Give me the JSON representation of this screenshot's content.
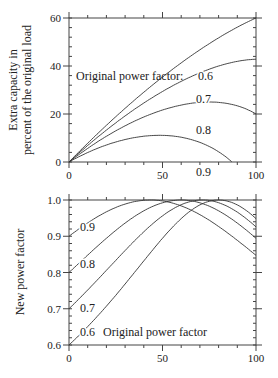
{
  "chart_data": [
    {
      "type": "line",
      "title": "",
      "xlabel": "",
      "ylabel": [
        "Extra capacity in",
        "percent of the original load"
      ],
      "xlim": [
        0,
        100
      ],
      "ylim": [
        0,
        60
      ],
      "xticks": [
        "0",
        "50",
        "100"
      ],
      "yticks": [
        "0",
        "20",
        "40",
        "60"
      ],
      "legend_title": "Original power factor:",
      "series": [
        {
          "name": "0.6",
          "x": [
            0,
            10,
            20,
            30,
            40,
            50,
            60,
            70,
            80,
            90,
            100
          ],
          "values": [
            0,
            7.3,
            14.8,
            22.4,
            30.0,
            37.4,
            44.2,
            50.2,
            55.0,
            58.4,
            60.0
          ]
        },
        {
          "name": "0.7",
          "x": [
            0,
            10,
            20,
            30,
            40,
            50,
            60,
            70,
            80,
            90,
            100
          ],
          "values": [
            0,
            6.6,
            13.2,
            19.6,
            25.5,
            30.8,
            35.3,
            38.8,
            41.2,
            42.5,
            42.9
          ]
        },
        {
          "name": "0.8",
          "x": [
            0,
            10,
            20,
            30,
            40,
            50,
            60,
            70,
            80,
            90,
            100
          ],
          "values": [
            0,
            5.5,
            10.6,
            15.1,
            18.9,
            21.9,
            23.9,
            25.0,
            25.0,
            23.8,
            21.6
          ]
        },
        {
          "name": "0.9",
          "x": [
            0,
            10,
            20,
            30,
            40,
            50,
            60,
            70,
            80,
            87
          ],
          "values": [
            0,
            3.8,
            6.9,
            9.3,
            10.6,
            11.0,
            10.3,
            8.3,
            4.6,
            0
          ]
        }
      ]
    },
    {
      "type": "line",
      "title": "",
      "xlabel": "",
      "ylabel": "New power factor",
      "xlim": [
        0,
        100
      ],
      "ylim": [
        0.6,
        1.0
      ],
      "xticks": [
        "0",
        "50",
        "100"
      ],
      "yticks": [
        "0.6",
        "0.7",
        "0.8",
        "0.9",
        "1.0"
      ],
      "legend_title": "Original power factor",
      "series": [
        {
          "name": "0.6",
          "x": [
            0,
            20,
            40,
            60,
            80,
            100
          ],
          "values": [
            0.6,
            0.683,
            0.8,
            0.949,
            1.0,
            0.949
          ]
        },
        {
          "name": "0.7",
          "x": [
            0,
            20,
            40,
            60,
            71,
            100
          ],
          "values": [
            0.7,
            0.793,
            0.905,
            0.989,
            1.0,
            0.923
          ]
        },
        {
          "name": "0.8",
          "x": [
            0,
            20,
            40,
            60,
            80,
            100
          ],
          "values": [
            0.8,
            0.894,
            0.97,
            1.0,
            0.97,
            0.894
          ]
        },
        {
          "name": "0.9",
          "x": [
            0,
            20,
            44,
            60,
            80,
            100
          ],
          "values": [
            0.9,
            0.965,
            1.0,
            0.989,
            0.935,
            0.847
          ]
        }
      ]
    }
  ]
}
